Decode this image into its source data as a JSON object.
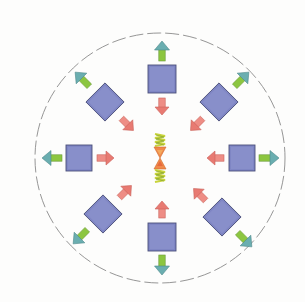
{
  "diagram": {
    "type": "radial-force-diagram",
    "canvas": {
      "width": 305,
      "height": 302,
      "background": "#fdfdfc"
    },
    "boundary": {
      "shape": "circle",
      "style": "dashed",
      "cx": 160,
      "cy": 158,
      "r": 125,
      "stroke": "#8a8a8a"
    },
    "colors": {
      "block_fill": "#7f86c4",
      "block_stroke": "#4a4f7a",
      "outward_arrow_body": "#8cc63f",
      "outward_arrow_head": "#6aaeb0",
      "inward_arrow": "#e87a72",
      "center_orange": "#f08a4b",
      "center_spring": "#c8d43a"
    },
    "blocks": [
      {
        "id": "top",
        "cx": 162,
        "cy": 79,
        "size": 28,
        "angle": 0,
        "direction_deg": -90
      },
      {
        "id": "top-right",
        "cx": 219,
        "cy": 102,
        "size": 27,
        "angle": 45,
        "direction_deg": -45
      },
      {
        "id": "right",
        "cx": 242,
        "cy": 158,
        "size": 26,
        "angle": 0,
        "direction_deg": 0
      },
      {
        "id": "bottom-right",
        "cx": 222,
        "cy": 217,
        "size": 27,
        "angle": 45,
        "direction_deg": 45
      },
      {
        "id": "bottom",
        "cx": 162,
        "cy": 237,
        "size": 28,
        "angle": 0,
        "direction_deg": 90
      },
      {
        "id": "bottom-left",
        "cx": 103,
        "cy": 214,
        "size": 27,
        "angle": 45,
        "direction_deg": 135
      },
      {
        "id": "left",
        "cx": 79,
        "cy": 158,
        "size": 26,
        "angle": 0,
        "direction_deg": 180
      },
      {
        "id": "top-left",
        "cx": 105,
        "cy": 102,
        "size": 27,
        "angle": 45,
        "direction_deg": -135
      }
    ],
    "arrows": {
      "outward": {
        "label": "outward force",
        "count": 8,
        "color": "green-teal"
      },
      "inward": {
        "label": "inward force",
        "count": 8,
        "color": "red"
      }
    },
    "center": {
      "cx": 160,
      "cy": 158,
      "elements": [
        "spring-top",
        "hourglass-triangles",
        "spring-bottom"
      ]
    }
  }
}
